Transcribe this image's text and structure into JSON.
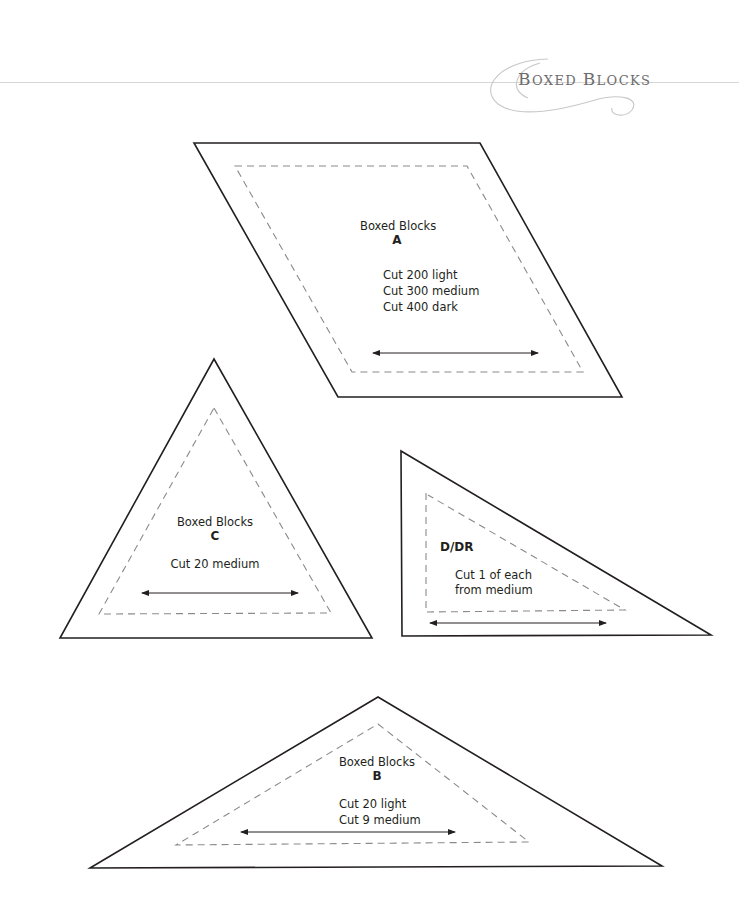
{
  "header": {
    "title": "Boxed Blocks",
    "title_first": "B",
    "title_mid": "OXED ",
    "title_second": "B",
    "title_end": "LOCKS",
    "rule_color": "#d6d6d6",
    "ornament": "swirl-flourish"
  },
  "templates": [
    {
      "id": "A",
      "shape": "parallelogram",
      "name": "Boxed Blocks",
      "letter": "A",
      "cut_lines": [
        "Cut 200 light",
        "Cut 300 medium",
        "Cut 400 dark"
      ],
      "grain_arrow": "horizontal double-headed arrow"
    },
    {
      "id": "C",
      "shape": "equilateral-triangle",
      "name": "Boxed Blocks",
      "letter": "C",
      "cut_lines": [
        "Cut 20 medium"
      ],
      "grain_arrow": "horizontal double-headed arrow"
    },
    {
      "id": "D/DR",
      "shape": "right-triangle",
      "letter": "D/DR",
      "cut_lines": [
        "Cut 1 of each",
        "from medium"
      ],
      "grain_arrow": "horizontal double-headed arrow"
    },
    {
      "id": "B",
      "shape": "obtuse-isosceles-triangle",
      "name": "Boxed Blocks",
      "letter": "B",
      "cut_lines": [
        "Cut 20 light",
        "Cut 9 medium"
      ],
      "grain_arrow": "horizontal double-headed arrow"
    }
  ],
  "colors": {
    "outline": "#231f20",
    "seam_dash": "#8a8a8a",
    "ornament": "#c8c8c8"
  }
}
